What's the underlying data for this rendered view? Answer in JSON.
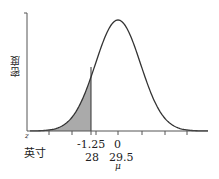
{
  "chart_data": {
    "type": "area",
    "title": "",
    "ylabel": "密度",
    "xlabel": "",
    "curve": "normal distribution density",
    "mean": 29.5,
    "shaded_region": {
      "from": "-inf",
      "to_z": -1.25,
      "to_x": 28
    },
    "axis_rows": {
      "z_label": "z",
      "x_label": "英寸"
    },
    "ticks": [
      {
        "z": "-1.25",
        "x": "28"
      },
      {
        "z": "0",
        "x": "29.5",
        "sub": "μ"
      }
    ],
    "colors": {
      "shade": "#aaaaaa",
      "curve": "#333333",
      "axis": "#555555"
    }
  }
}
